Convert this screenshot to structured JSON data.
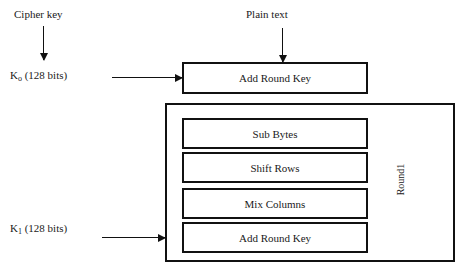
{
  "diagram": {
    "inputs": {
      "cipher_key_label": "Cipher key",
      "plain_text_label": "Plain text"
    },
    "keys": [
      {
        "name": "K",
        "subscript": "o",
        "bits": "(128 bits)",
        "full": "K o (128 bits)"
      },
      {
        "name": "K",
        "subscript": "1",
        "bits": "(128 bits)",
        "full": "K 1 (128 bits)"
      }
    ],
    "initial_stage": {
      "label": "Add Round Key"
    },
    "round": {
      "label": "Round1",
      "steps": [
        {
          "label": "Sub Bytes"
        },
        {
          "label": "Shift Rows"
        },
        {
          "label": "Mix Columns"
        },
        {
          "label": "Add Round Key"
        }
      ]
    },
    "colors": {
      "stroke": "#111111",
      "background": "#ffffff",
      "text": "#1a1a1a"
    }
  }
}
